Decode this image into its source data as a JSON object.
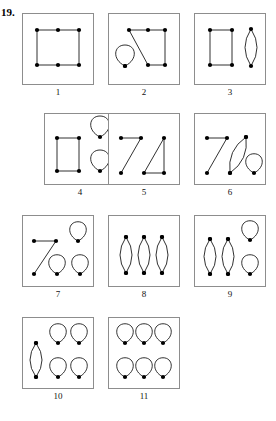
{
  "header": {
    "problem_number": "19.",
    "cutoff_text": "... .... ..... ... ..."
  },
  "figure": {
    "type": "graph-diagram-grid",
    "panels": [
      {
        "label": "1",
        "box": {
          "x": 22,
          "y": 13,
          "w": 72,
          "h": 72
        },
        "vertices": [
          {
            "x": 15,
            "y": 17
          },
          {
            "x": 36,
            "y": 17
          },
          {
            "x": 57,
            "y": 17
          },
          {
            "x": 15,
            "y": 52
          },
          {
            "x": 36,
            "y": 52
          },
          {
            "x": 57,
            "y": 52
          }
        ],
        "edges": [
          {
            "from": 0,
            "to": 1
          },
          {
            "from": 1,
            "to": 2
          },
          {
            "from": 0,
            "to": 3
          },
          {
            "from": 2,
            "to": 5
          },
          {
            "from": 3,
            "to": 4
          },
          {
            "from": 4,
            "to": 5
          }
        ],
        "loops": [],
        "lenses": []
      },
      {
        "label": "2",
        "box": {
          "x": 108,
          "y": 13,
          "w": 72,
          "h": 72
        },
        "vertices": [
          {
            "x": 21,
            "y": 17
          },
          {
            "x": 40,
            "y": 17
          },
          {
            "x": 57,
            "y": 17
          },
          {
            "x": 40,
            "y": 52
          },
          {
            "x": 57,
            "y": 52
          },
          {
            "x": 17,
            "y": 53
          }
        ],
        "edges": [
          {
            "from": 0,
            "to": 1
          },
          {
            "from": 1,
            "to": 2
          },
          {
            "from": 2,
            "to": 4
          },
          {
            "from": 3,
            "to": 4
          },
          {
            "from": 0,
            "to": 3
          }
        ],
        "loops": [
          {
            "vertex": 5,
            "dir": "up",
            "rx": 9,
            "ry": 12
          }
        ],
        "lenses": []
      },
      {
        "label": "3",
        "box": {
          "x": 194,
          "y": 13,
          "w": 72,
          "h": 72
        },
        "vertices": [
          {
            "x": 16,
            "y": 17
          },
          {
            "x": 38,
            "y": 17
          },
          {
            "x": 16,
            "y": 52
          },
          {
            "x": 38,
            "y": 52
          }
        ],
        "edges": [
          {
            "from": 0,
            "to": 1
          },
          {
            "from": 0,
            "to": 2
          },
          {
            "from": 1,
            "to": 3
          },
          {
            "from": 2,
            "to": 3
          }
        ],
        "loops": [],
        "lenses": [
          {
            "x": 57,
            "y1": 16,
            "y2": 53,
            "bulge": 6
          }
        ]
      },
      {
        "label": "4",
        "box": {
          "x": 44,
          "y": 113,
          "w": 72,
          "h": 72
        },
        "vertices": [
          {
            "x": 13,
            "y": 25
          },
          {
            "x": 35,
            "y": 25
          },
          {
            "x": 13,
            "y": 58
          },
          {
            "x": 35,
            "y": 58
          }
        ],
        "edges": [
          {
            "from": 0,
            "to": 1
          },
          {
            "from": 0,
            "to": 2
          },
          {
            "from": 1,
            "to": 3
          },
          {
            "from": 2,
            "to": 3
          }
        ],
        "loops": [
          {
            "cx": 56,
            "cy": 24,
            "dir": "up",
            "rx": 9,
            "ry": 12
          },
          {
            "cx": 56,
            "cy": 58,
            "dir": "up",
            "rx": 9,
            "ry": 12
          }
        ],
        "lenses": []
      },
      {
        "label": "5",
        "box": {
          "x": 108,
          "y": 113,
          "w": 72,
          "h": 72
        },
        "vertices": [
          {
            "x": 13,
            "y": 25
          },
          {
            "x": 33,
            "y": 25
          },
          {
            "x": 13,
            "y": 60
          },
          {
            "x": 36,
            "y": 60
          },
          {
            "x": 56,
            "y": 25
          },
          {
            "x": 56,
            "y": 60
          }
        ],
        "edges": [
          {
            "from": 0,
            "to": 1
          },
          {
            "from": 1,
            "to": 2
          },
          {
            "from": 3,
            "to": 4
          },
          {
            "from": 4,
            "to": 5
          },
          {
            "from": 3,
            "to": 5
          }
        ],
        "loops": [],
        "lenses": []
      },
      {
        "label": "6",
        "box": {
          "x": 194,
          "y": 113,
          "w": 72,
          "h": 72
        },
        "vertices": [
          {
            "x": 13,
            "y": 25
          },
          {
            "x": 33,
            "y": 25
          },
          {
            "x": 13,
            "y": 60
          },
          {
            "x": 36,
            "y": 60
          },
          {
            "x": 52,
            "y": 24
          }
        ],
        "edges": [
          {
            "from": 0,
            "to": 1
          },
          {
            "from": 1,
            "to": 2
          }
        ],
        "loops": [
          {
            "cx": 60,
            "cy": 60,
            "dir": "up",
            "rx": 8,
            "ry": 11
          }
        ],
        "lenses": [
          {
            "x1": 36,
            "y1": 60,
            "x2": 52,
            "y2": 24,
            "bulge": 6
          }
        ]
      },
      {
        "label": "7",
        "box": {
          "x": 22,
          "y": 215,
          "w": 72,
          "h": 72
        },
        "vertices": [
          {
            "x": 12,
            "y": 26
          },
          {
            "x": 34,
            "y": 26
          },
          {
            "x": 12,
            "y": 59
          }
        ],
        "edges": [
          {
            "from": 0,
            "to": 1
          },
          {
            "from": 1,
            "to": 2
          }
        ],
        "loops": [
          {
            "cx": 56,
            "cy": 26,
            "dir": "up",
            "rx": 8,
            "ry": 11
          },
          {
            "cx": 35,
            "cy": 59,
            "dir": "up",
            "rx": 8,
            "ry": 11
          },
          {
            "cx": 58,
            "cy": 59,
            "dir": "up",
            "rx": 8,
            "ry": 11
          }
        ],
        "lenses": []
      },
      {
        "label": "8",
        "box": {
          "x": 108,
          "y": 215,
          "w": 72,
          "h": 72
        },
        "vertices": [
          {
            "x": 18,
            "y": 22
          },
          {
            "x": 18,
            "y": 58
          },
          {
            "x": 36,
            "y": 22
          },
          {
            "x": 36,
            "y": 58
          },
          {
            "x": 54,
            "y": 22
          },
          {
            "x": 54,
            "y": 58
          }
        ],
        "edges": [],
        "loops": [],
        "lenses": [
          {
            "x": 18,
            "y1": 22,
            "y2": 58,
            "bulge": 6
          },
          {
            "x": 36,
            "y1": 22,
            "y2": 58,
            "bulge": 6
          },
          {
            "x": 54,
            "y1": 22,
            "y2": 58,
            "bulge": 6
          }
        ]
      },
      {
        "label": "9",
        "box": {
          "x": 194,
          "y": 215,
          "w": 72,
          "h": 72
        },
        "vertices": [
          {
            "x": 16,
            "y": 24
          },
          {
            "x": 16,
            "y": 59
          },
          {
            "x": 34,
            "y": 24
          },
          {
            "x": 34,
            "y": 59
          }
        ],
        "edges": [],
        "loops": [
          {
            "cx": 56,
            "cy": 25,
            "dir": "up",
            "rx": 8,
            "ry": 11
          },
          {
            "cx": 56,
            "cy": 59,
            "dir": "up",
            "rx": 8,
            "ry": 11
          }
        ],
        "lenses": [
          {
            "x": 16,
            "y1": 24,
            "y2": 59,
            "bulge": 6
          },
          {
            "x": 34,
            "y1": 24,
            "y2": 59,
            "bulge": 6
          }
        ]
      },
      {
        "label": "10",
        "box": {
          "x": 22,
          "y": 317,
          "w": 72,
          "h": 72
        },
        "vertices": [
          {
            "x": 14,
            "y": 26
          },
          {
            "x": 14,
            "y": 60
          }
        ],
        "edges": [],
        "loops": [
          {
            "cx": 36,
            "cy": 26,
            "dir": "up",
            "rx": 8,
            "ry": 11
          },
          {
            "cx": 57,
            "cy": 26,
            "dir": "up",
            "rx": 8,
            "ry": 11
          },
          {
            "cx": 36,
            "cy": 60,
            "dir": "up",
            "rx": 8,
            "ry": 11
          },
          {
            "cx": 57,
            "cy": 60,
            "dir": "up",
            "rx": 8,
            "ry": 11
          }
        ],
        "lenses": [
          {
            "x": 14,
            "y1": 26,
            "y2": 60,
            "bulge": 6
          }
        ]
      },
      {
        "label": "11",
        "box": {
          "x": 108,
          "y": 317,
          "w": 72,
          "h": 72
        },
        "vertices": [],
        "edges": [],
        "loops": [
          {
            "cx": 17,
            "cy": 26,
            "dir": "up",
            "rx": 8,
            "ry": 11
          },
          {
            "cx": 36,
            "cy": 26,
            "dir": "up",
            "rx": 8,
            "ry": 11
          },
          {
            "cx": 55,
            "cy": 26,
            "dir": "up",
            "rx": 8,
            "ry": 11
          },
          {
            "cx": 17,
            "cy": 60,
            "dir": "up",
            "rx": 8,
            "ry": 11
          },
          {
            "cx": 36,
            "cy": 60,
            "dir": "up",
            "rx": 8,
            "ry": 11
          },
          {
            "cx": 55,
            "cy": 60,
            "dir": "up",
            "rx": 8,
            "ry": 11
          }
        ],
        "lenses": []
      }
    ]
  },
  "style": {
    "border_color": "#8d8d8d",
    "stroke_color": "#1a1a1a",
    "vertex_color": "#000000",
    "vertex_radius": 2.1,
    "stroke_width": 0.9,
    "background": "#ffffff"
  }
}
